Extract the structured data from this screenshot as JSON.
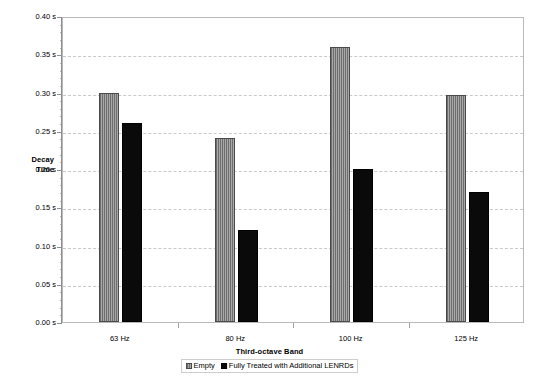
{
  "chart_data": {
    "type": "bar",
    "title": "",
    "xlabel": "Third-octave Band",
    "ylabel": "Decay Time",
    "categories": [
      "63 Hz",
      "80 Hz",
      "100 Hz",
      "125 Hz"
    ],
    "series": [
      {
        "name": "Empty",
        "values": [
          0.3,
          0.24,
          0.36,
          0.297
        ],
        "color": "#8c8c8c"
      },
      {
        "name": "Fully Treated with Additional LENRDs",
        "values": [
          0.26,
          0.12,
          0.2,
          0.17
        ],
        "color": "#0a0a0a"
      }
    ],
    "ylim": [
      0.0,
      0.4
    ],
    "ytick_values": [
      0.0,
      0.05,
      0.1,
      0.15,
      0.2,
      0.25,
      0.3,
      0.35,
      0.4
    ],
    "ytick_labels": [
      "0.00 s",
      "0.05 s",
      "0.10 s",
      "0.15 s",
      "0.20 s",
      "0.25 s",
      "0.30 s",
      "0.35 s",
      "0.40 s"
    ],
    "y_unit": "s",
    "grid": "horizontal-dashed",
    "legend_position": "bottom-center",
    "y_minor_ticks_per_interval": 5
  },
  "axis": {
    "y_title_line1": "Decay",
    "y_title_line2": "Time",
    "x_title": "Third-octave Band"
  },
  "legend": {
    "items": [
      {
        "label": "Empty"
      },
      {
        "label": "Fully Treated with Additional LENRDs"
      }
    ]
  }
}
